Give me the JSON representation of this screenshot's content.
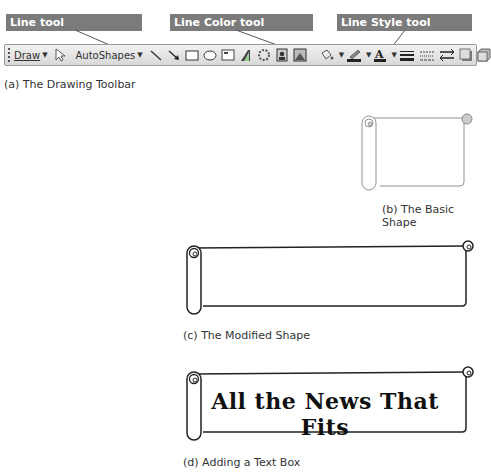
{
  "callouts": {
    "line_tool": "Line tool",
    "line_color_tool": "Line Color tool",
    "line_style_tool": "Line Style tool"
  },
  "toolbar": {
    "draw_label": "Draw",
    "autoshapes_label": "AutoShapes",
    "icons": [
      "select-pointer",
      "line",
      "arrow",
      "rectangle",
      "oval",
      "text-box",
      "wordart",
      "diagram",
      "clip-art",
      "picture",
      "fill-color",
      "line-color",
      "font-color",
      "line-style",
      "dash-style",
      "arrow-style",
      "shadow-style",
      "3d-style"
    ]
  },
  "captions": {
    "a": "(a) The Drawing Toolbar",
    "b": "(b) The Basic Shape",
    "c": "(c) The Modified Shape",
    "d": "(d) Adding a Text Box"
  },
  "banner": {
    "text": "All the News That Fits"
  },
  "colors": {
    "callout_bg": "#7b7b7b",
    "callout_text": "#ffffff",
    "toolbar_bg": "#e4e4e4"
  }
}
